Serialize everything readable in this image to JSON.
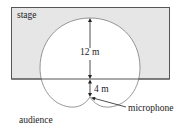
{
  "diagram": {
    "labels": {
      "stage": "stage",
      "audience": "audience",
      "microphone": "microphone",
      "distance_upper": "12 m",
      "distance_lower": "4 m"
    },
    "colors": {
      "stage_fill": "#e6e6e6",
      "stage_border": "#555555",
      "pickup_pattern": "#8a8a8a",
      "dimension_line": "#222222"
    },
    "measurements": {
      "max_pickup_forward_m": 12,
      "mic_to_stage_edge_m": 4
    },
    "pattern_type": "cardioid"
  }
}
